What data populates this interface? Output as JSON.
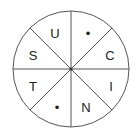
{
  "diagram": {
    "type": "letter-wheel",
    "center": [
      71,
      69
    ],
    "radius": 58,
    "line_color": "#555555",
    "sectors": [
      {
        "position": "top-right",
        "label": "•",
        "x": 88,
        "y": 33
      },
      {
        "position": "right-top",
        "label": "C",
        "x": 110,
        "y": 55
      },
      {
        "position": "right-bottom",
        "label": "I",
        "x": 111,
        "y": 86
      },
      {
        "position": "bottom-right",
        "label": "N",
        "x": 86,
        "y": 107
      },
      {
        "position": "bottom-left",
        "label": "•",
        "x": 57,
        "y": 107
      },
      {
        "position": "left-bottom",
        "label": "T",
        "x": 33,
        "y": 86
      },
      {
        "position": "left-top",
        "label": "S",
        "x": 33,
        "y": 55
      },
      {
        "position": "top-left",
        "label": "U",
        "x": 55,
        "y": 33
      }
    ]
  }
}
